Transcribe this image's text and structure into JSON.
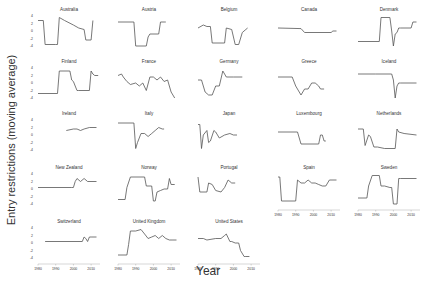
{
  "chart_data": {
    "type": "line",
    "title": "",
    "xlabel": "Year",
    "ylabel": "Entry restrictions (moving average)",
    "xlim": [
      1980,
      2015
    ],
    "x_ticks": [
      "1980",
      "1990",
      "2000",
      "2010"
    ],
    "y_ticks": [
      "4",
      "2",
      "0",
      "-2",
      "-4"
    ],
    "grid": false,
    "layout": {
      "columns": 5,
      "rows": 5
    },
    "note": "y values are normalized panel positions (0 = top, 1 = bottom), estimated from image",
    "panels": [
      {
        "name": "Australia",
        "col": 0,
        "row": 0,
        "x": [
          1980,
          1983,
          1984,
          1990,
          1991,
          1992,
          1995,
          2000,
          2003,
          2006,
          2007,
          2010,
          2011
        ],
        "y": [
          0.15,
          0.15,
          0.95,
          0.95,
          0.95,
          0.05,
          0.15,
          0.3,
          0.4,
          0.45,
          0.8,
          0.8,
          0.15
        ]
      },
      {
        "name": "Austria",
        "col": 1,
        "row": 0,
        "x": [
          1980,
          1989,
          1990,
          1996,
          1997,
          1998,
          2003,
          2004,
          2006,
          2007
        ],
        "y": [
          0.2,
          0.2,
          1.0,
          1.0,
          0.7,
          0.6,
          0.6,
          0.2,
          0.2,
          0.2
        ]
      },
      {
        "name": "Belgium",
        "col": 2,
        "row": 0,
        "x": [
          1980,
          1983,
          1985,
          1987,
          1988,
          1995,
          1996,
          1999,
          2001,
          2003,
          2005,
          2007,
          2008
        ],
        "y": [
          0.4,
          0.3,
          0.35,
          0.35,
          0.9,
          0.9,
          0.4,
          0.45,
          0.95,
          0.95,
          0.55,
          0.45,
          0.4
        ]
      },
      {
        "name": "Canada",
        "col": 3,
        "row": 0,
        "x": [
          1980,
          1993,
          1995,
          2010,
          2011,
          2013
        ],
        "y": [
          0.4,
          0.42,
          0.55,
          0.55,
          0.5,
          0.5
        ]
      },
      {
        "name": "Denmark",
        "col": 4,
        "row": 0,
        "x": [
          1980,
          1992,
          1993,
          1998,
          1999,
          2000,
          2001,
          2002,
          2003,
          2004,
          2010,
          2011,
          2013
        ],
        "y": [
          0.85,
          0.85,
          0.05,
          0.05,
          0.5,
          1.0,
          0.6,
          0.55,
          0.4,
          0.4,
          0.4,
          0.2,
          0.2
        ]
      },
      {
        "name": "Finland",
        "col": 0,
        "row": 1,
        "x": [
          1980,
          1991,
          1992,
          1998,
          1999,
          2000,
          2001,
          2002,
          2003,
          2009,
          2010,
          2011,
          2012,
          2014
        ],
        "y": [
          0.85,
          0.85,
          0.1,
          0.1,
          0.4,
          0.45,
          0.6,
          0.75,
          0.75,
          0.75,
          0.1,
          0.2,
          0.25,
          0.25
        ]
      },
      {
        "name": "France",
        "col": 1,
        "row": 1,
        "x": [
          1980,
          1982,
          1983,
          1985,
          1987,
          1990,
          1992,
          1994,
          1996,
          1998,
          2000,
          2002,
          2004,
          2006,
          2008,
          2010,
          2012
        ],
        "y": [
          0.25,
          0.2,
          0.3,
          0.45,
          0.55,
          0.5,
          0.6,
          0.5,
          0.75,
          0.3,
          0.3,
          0.4,
          0.3,
          0.45,
          0.4,
          0.8,
          1.0
        ]
      },
      {
        "name": "Germany",
        "col": 2,
        "row": 1,
        "x": [
          1980,
          1982,
          1984,
          1986,
          1988,
          1990,
          1992,
          1994,
          1995,
          1996,
          2000,
          2005
        ],
        "y": [
          0.4,
          0.4,
          0.8,
          0.9,
          0.9,
          0.6,
          0.6,
          0.1,
          0.2,
          0.3,
          0.3,
          0.3
        ]
      },
      {
        "name": "Greece",
        "col": 3,
        "row": 1,
        "x": [
          1980,
          1988,
          1990,
          1993,
          1995,
          1997,
          1999,
          2001,
          2003,
          2004,
          2006
        ],
        "y": [
          0.3,
          0.3,
          0.6,
          0.9,
          0.7,
          0.7,
          0.5,
          0.5,
          0.6,
          0.7,
          0.7
        ]
      },
      {
        "name": "Iceland",
        "col": 4,
        "row": 1,
        "x": [
          1980,
          1990,
          1999,
          2000,
          2001,
          2002,
          2003,
          2004,
          2013
        ],
        "y": [
          0.2,
          0.2,
          0.2,
          0.4,
          1.0,
          0.6,
          0.5,
          0.5,
          0.5
        ]
      },
      {
        "name": "Ireland",
        "col": 0,
        "row": 2,
        "x": [
          1996,
          2000,
          2002,
          2004,
          2006,
          2009,
          2013
        ],
        "y": [
          0.35,
          0.3,
          0.3,
          0.35,
          0.3,
          0.25,
          0.25
        ]
      },
      {
        "name": "Italy",
        "col": 1,
        "row": 2,
        "x": [
          1980,
          1989,
          1990,
          1991,
          1993,
          1995,
          1997,
          1999,
          2001,
          2003,
          2005,
          2006
        ],
        "y": [
          0.1,
          0.1,
          0.95,
          0.75,
          0.45,
          0.45,
          0.55,
          0.45,
          0.35,
          0.25,
          0.3,
          0.3
        ]
      },
      {
        "name": "Japan",
        "col": 2,
        "row": 2,
        "x": [
          1980,
          1981,
          1982,
          1983,
          1985,
          1986,
          1987,
          1989,
          1990,
          1992,
          1995,
          1998,
          2000,
          2002
        ],
        "y": [
          0.15,
          0.15,
          0.95,
          0.5,
          0.35,
          0.75,
          0.7,
          0.35,
          0.4,
          0.6,
          0.5,
          0.45,
          0.5,
          0.5
        ]
      },
      {
        "name": "Luxembourg",
        "col": 3,
        "row": 2,
        "x": [
          1980,
          1991,
          1993,
          2003,
          2004,
          2005,
          2006,
          2007
        ],
        "y": [
          0.4,
          0.4,
          0.8,
          0.8,
          0.5,
          0.5,
          0.7,
          0.7
        ]
      },
      {
        "name": "Netherlands",
        "col": 4,
        "row": 2,
        "x": [
          1980,
          1983,
          1984,
          1986,
          1987,
          1989,
          1991,
          1995,
          2001,
          2002,
          2003,
          2006,
          2013
        ],
        "y": [
          0.3,
          0.3,
          0.85,
          0.5,
          0.55,
          0.9,
          0.9,
          0.95,
          0.95,
          0.3,
          0.4,
          0.45,
          0.5
        ]
      },
      {
        "name": "New Zealand",
        "col": 0,
        "row": 3,
        "x": [
          1980,
          1999,
          2000,
          2001,
          2002,
          2004,
          2006,
          2008,
          2013
        ],
        "y": [
          0.45,
          0.45,
          0.45,
          0.25,
          0.15,
          0.25,
          0.15,
          0.25,
          0.25
        ]
      },
      {
        "name": "Norway",
        "col": 1,
        "row": 3,
        "x": [
          1980,
          1984,
          1985,
          1987,
          1995,
          1996,
          1999,
          2000,
          2001,
          2002,
          2004,
          2006,
          2008,
          2009,
          2010,
          2012
        ],
        "y": [
          0.85,
          0.85,
          0.45,
          0.1,
          0.1,
          0.4,
          0.4,
          0.9,
          0.9,
          0.6,
          0.55,
          0.5,
          0.5,
          0.15,
          0.35,
          0.35
        ]
      },
      {
        "name": "Portugal",
        "col": 2,
        "row": 3,
        "x": [
          1980,
          1981,
          1985,
          1986,
          1988,
          1990,
          1993,
          1995,
          1997,
          1999,
          2001
        ],
        "y": [
          0.1,
          0.6,
          0.6,
          0.3,
          0.35,
          0.55,
          0.6,
          0.45,
          0.2,
          0.3,
          0.3
        ]
      },
      {
        "name": "Spain",
        "col": 3,
        "row": 3,
        "x": [
          1980,
          1981,
          1982,
          1989,
          1990,
          1991,
          1993,
          1995,
          1997,
          1999,
          2001,
          2003,
          2005,
          2007,
          2009,
          2013
        ],
        "y": [
          0.1,
          0.1,
          0.9,
          0.9,
          0.9,
          0.2,
          0.3,
          0.3,
          0.2,
          0.3,
          0.3,
          0.35,
          0.4,
          0.4,
          0.2,
          0.2
        ]
      },
      {
        "name": "Sweden",
        "col": 4,
        "row": 3,
        "x": [
          1980,
          1985,
          1986,
          1988,
          1992,
          1993,
          1995,
          1998,
          1999,
          2000,
          2002,
          2003,
          2004,
          2013
        ],
        "y": [
          0.8,
          0.8,
          0.4,
          0.05,
          0.05,
          0.4,
          0.4,
          0.45,
          0.45,
          1.0,
          1.0,
          0.15,
          0.15,
          0.15
        ]
      },
      {
        "name": "Switzerland",
        "col": 0,
        "row": 4,
        "x": [
          1984,
          2005,
          2006,
          2007,
          2008,
          2009,
          2010,
          2013
        ],
        "y": [
          0.45,
          0.45,
          0.3,
          0.35,
          0.45,
          0.3,
          0.3,
          0.3
        ]
      },
      {
        "name": "United Kingdom",
        "col": 1,
        "row": 4,
        "x": [
          1980,
          1985,
          1986,
          1987,
          1990,
          1993,
          1995,
          1997,
          1999,
          2001,
          2003,
          2005,
          2007,
          2009,
          2011,
          2013
        ],
        "y": [
          0.9,
          0.9,
          0.55,
          0.1,
          0.1,
          0.05,
          0.2,
          0.35,
          0.3,
          0.25,
          0.35,
          0.25,
          0.35,
          0.4,
          0.4,
          0.4
        ]
      },
      {
        "name": "United States",
        "col": 2,
        "row": 4,
        "x": [
          1980,
          1983,
          1985,
          1990,
          1993,
          1995,
          1996,
          1998,
          1999,
          2001,
          2003,
          2004,
          2006,
          2007,
          2009
        ],
        "y": [
          0.35,
          0.35,
          0.4,
          0.35,
          0.35,
          0.25,
          0.2,
          0.45,
          0.45,
          0.5,
          0.5,
          0.75,
          0.95,
          0.95,
          0.95
        ]
      }
    ],
    "x_axis_panels": [
      {
        "col": 0,
        "row": 4
      },
      {
        "col": 1,
        "row": 4
      },
      {
        "col": 2,
        "row": 4
      },
      {
        "col": 3,
        "row": 3
      },
      {
        "col": 4,
        "row": 3
      }
    ],
    "y_axis_panels": [
      {
        "col": 0,
        "row": 0
      },
      {
        "col": 0,
        "row": 1
      },
      {
        "col": 0,
        "row": 2
      },
      {
        "col": 0,
        "row": 3
      },
      {
        "col": 0,
        "row": 4
      }
    ]
  },
  "labels": {
    "ylabel": "Entry restrictions (moving average)",
    "xlabel": "Year"
  },
  "colors": {
    "line": "#555555",
    "axis": "#999999",
    "text": "#333333"
  }
}
